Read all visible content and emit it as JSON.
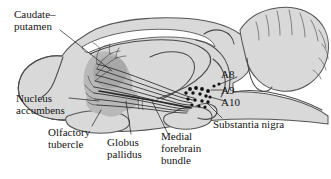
{
  "figure": {
    "kind": "anatomical-diagram",
    "background_color": "#ffffff",
    "brain_fill_color": "#d9d9d9",
    "outline_color": "#4a4a4a",
    "nucleus_fill_color": "#a8a8a8",
    "fiber_color": "#2a2a2a",
    "cell_body_color": "#101010",
    "text_color": "#141414"
  },
  "labels": {
    "caudate_putamen": {
      "line1": "Caudate–",
      "line2": "putamen"
    },
    "nucleus_accumbens": {
      "line1": "Nucleus",
      "line2": "accumbens"
    },
    "olfactory_tubercle": {
      "line1": "Olfactory",
      "line2": "tubercle"
    },
    "globus_pallidus": {
      "line1": "Globus",
      "line2": "pallidus"
    },
    "medial_forebrain_bundle": {
      "line1": "Medial",
      "line2": "forebrain",
      "line3": "bundle"
    },
    "substantia_nigra": {
      "line1": "Substantia nigra"
    },
    "cell_group_a8": "A8",
    "cell_group_a9": "A9",
    "cell_group_a10": "A10"
  }
}
